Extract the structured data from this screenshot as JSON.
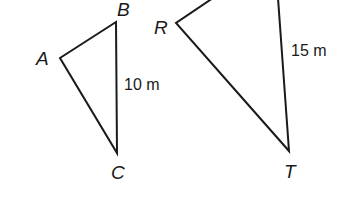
{
  "figure": {
    "triangle_abc": {
      "vertices": {
        "A": "A",
        "B": "B",
        "C": "C"
      },
      "side_bc_label": "10 m"
    },
    "triangle_rst": {
      "vertices": {
        "R": "R",
        "T": "T"
      },
      "side_st_label": "15 m"
    },
    "colors": {
      "stroke": "#1a1a1a",
      "background": "#ffffff"
    }
  }
}
